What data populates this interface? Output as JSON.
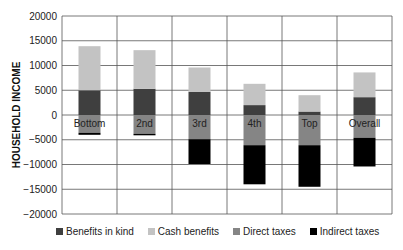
{
  "chart_data": {
    "type": "bar",
    "stacked": true,
    "title": "",
    "xlabel": "",
    "ylabel": "HOUSEHOLD INCOME",
    "ylim": [
      -20000,
      20000
    ],
    "yticks": [
      20000,
      15000,
      10000,
      5000,
      0,
      -5000,
      -10000,
      -15000,
      -20000
    ],
    "ytick_labels": [
      "20000",
      "15000",
      "10000",
      "5000",
      "0",
      "−5000",
      "−10000",
      "−15000",
      "−20000"
    ],
    "grid": true,
    "legend_position": "bottom",
    "categories": [
      "Bottom",
      "2nd",
      "3rd",
      "4th",
      "Top",
      "Overall"
    ],
    "series": [
      {
        "name": "Benefits in kind",
        "color": "#3f3f3f",
        "values": [
          5000,
          5300,
          4700,
          2000,
          700,
          3600
        ]
      },
      {
        "name": "Cash benefits",
        "color": "#c3c3c3",
        "values": [
          8900,
          7800,
          4900,
          4300,
          3300,
          5000
        ]
      },
      {
        "name": "Direct taxes",
        "color": "#858585",
        "values": [
          -3600,
          -3800,
          -4900,
          -6100,
          -6100,
          -4600
        ]
      },
      {
        "name": "Indirect taxes",
        "color": "#000000",
        "values": [
          -400,
          -300,
          -5000,
          -7900,
          -8400,
          -5800
        ]
      }
    ]
  }
}
